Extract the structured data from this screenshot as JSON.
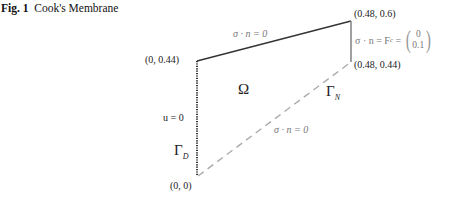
{
  "caption": {
    "fig_label": "Fig. 1",
    "title": "Cook's Membrane"
  },
  "diagram": {
    "vertices": {
      "top_left": "(0, 0.44)",
      "bottom_left": "(0, 0)",
      "top_right": "(0.48, 0.6)",
      "bottom_right": "(0.48, 0.44)"
    },
    "region_label": "Ω",
    "dirichlet_boundary": {
      "label": "Γ",
      "subscript": "D",
      "condition": "u = 0"
    },
    "neumann_boundary": {
      "label": "Γ",
      "subscript": "N"
    },
    "top_edge_condition": "σ · n = 0",
    "bottom_edge_condition": "σ · n = 0",
    "right_edge_condition": {
      "lhs": "σ · n = F",
      "subscript": "c",
      "eq": " = ",
      "vector_top": "0",
      "vector_bottom": "0.1"
    },
    "colors": {
      "top_edge": "#333333",
      "left_edge": "#333333",
      "right_edge": "#888888",
      "bottom_edge": "#999999"
    }
  }
}
